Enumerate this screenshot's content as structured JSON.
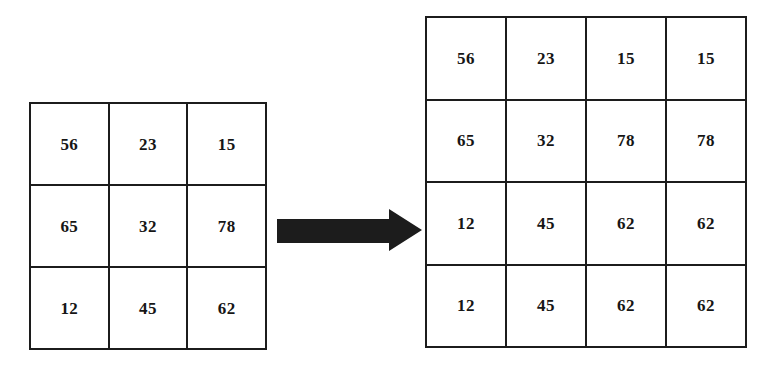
{
  "figure": {
    "background_color": "#ffffff",
    "line_color": "#1c1c1c",
    "text_color": "#161616"
  },
  "source_matrix": {
    "label": "source-matrix",
    "rows": 3,
    "cols": 3,
    "values": [
      [
        "56",
        "23",
        "15"
      ],
      [
        "65",
        "32",
        "78"
      ],
      [
        "12",
        "45",
        "62"
      ]
    ]
  },
  "arrow": {
    "icon": "right-arrow-icon",
    "direction": "right",
    "color": "#1c1c1c"
  },
  "result_matrix": {
    "label": "result-matrix",
    "rows": 4,
    "cols": 4,
    "values": [
      [
        "56",
        "23",
        "15",
        "15"
      ],
      [
        "65",
        "32",
        "78",
        "78"
      ],
      [
        "12",
        "45",
        "62",
        "62"
      ],
      [
        "12",
        "45",
        "62",
        "62"
      ]
    ]
  },
  "chart_data": {
    "type": "table",
    "title": "",
    "tables": [
      {
        "name": "source-matrix",
        "shape": [
          3,
          3
        ],
        "data": [
          [
            56,
            23,
            15
          ],
          [
            65,
            32,
            78
          ],
          [
            12,
            45,
            62
          ]
        ]
      },
      {
        "name": "result-matrix",
        "shape": [
          4,
          4
        ],
        "data": [
          [
            56,
            23,
            15,
            15
          ],
          [
            65,
            32,
            78,
            78
          ],
          [
            12,
            45,
            62,
            62
          ],
          [
            12,
            45,
            62,
            62
          ]
        ]
      }
    ]
  }
}
